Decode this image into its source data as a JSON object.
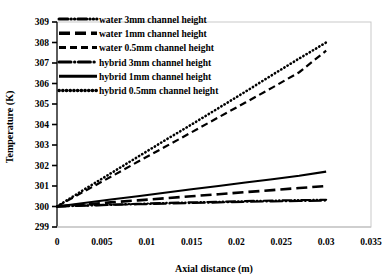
{
  "chart_data": {
    "type": "line",
    "title": "",
    "xlabel": "Axial distance (m)",
    "ylabel": "Temperature (K)",
    "xlim": [
      0,
      0.035
    ],
    "ylim": [
      299,
      309
    ],
    "xticks": [
      "0",
      "0.005",
      "0.01",
      "0.015",
      "0.02",
      "0.025",
      "0.03",
      "0.035"
    ],
    "xtick_values": [
      0,
      0.005,
      0.01,
      0.015,
      0.02,
      0.025,
      0.03,
      0.035
    ],
    "yticks": [
      "299",
      "300",
      "301",
      "302",
      "303",
      "304",
      "305",
      "306",
      "307",
      "308",
      "309"
    ],
    "ytick_values": [
      299,
      300,
      301,
      302,
      303,
      304,
      305,
      306,
      307,
      308,
      309
    ],
    "grid": false,
    "legend_position": "top-left",
    "x": [
      0,
      0.003,
      0.006,
      0.009,
      0.012,
      0.015,
      0.018,
      0.021,
      0.024,
      0.027,
      0.03
    ],
    "series": [
      {
        "name": "water 3mm channel height",
        "dash": "dashdotdot",
        "values": [
          300.0,
          300.05,
          300.09,
          300.13,
          300.17,
          300.2,
          300.23,
          300.26,
          300.29,
          300.31,
          300.33
        ]
      },
      {
        "name": "water 1mm channel height",
        "dash": "longdash",
        "values": [
          300.0,
          300.1,
          300.2,
          300.3,
          300.4,
          300.5,
          300.6,
          300.7,
          300.8,
          300.9,
          301.0
        ]
      },
      {
        "name": "water 0.5mm channel height",
        "dash": "dash",
        "values": [
          300.0,
          300.73,
          301.45,
          302.18,
          302.9,
          303.62,
          304.35,
          305.07,
          305.8,
          306.55,
          307.6
        ]
      },
      {
        "name": "hybrid 3mm channel height",
        "dash": "dashdot",
        "values": [
          300.0,
          300.04,
          300.08,
          300.11,
          300.14,
          300.17,
          300.2,
          300.23,
          300.25,
          300.27,
          300.29
        ]
      },
      {
        "name": "hybrid 1mm channel height",
        "dash": "solid",
        "values": [
          300.0,
          300.17,
          300.34,
          300.5,
          300.67,
          300.84,
          301.0,
          301.17,
          301.33,
          301.5,
          301.7
        ]
      },
      {
        "name": "hybrid 0.5mm channel height",
        "dash": "dot",
        "values": [
          300.0,
          300.82,
          301.62,
          302.42,
          303.22,
          304.0,
          304.8,
          305.6,
          306.42,
          307.22,
          308.0
        ]
      }
    ]
  },
  "legend": {
    "items": [
      {
        "label": "water 3mm channel height"
      },
      {
        "label": "water 1mm channel height"
      },
      {
        "label": "water 0.5mm channel height"
      },
      {
        "label": "hybrid 3mm channel height"
      },
      {
        "label": "hybrid 1mm channel height"
      },
      {
        "label": "hybrid 0.5mm channel height"
      }
    ]
  },
  "colors": {
    "series": "#000000",
    "frame": "#c9c9c9",
    "axis": "#000000",
    "background": "#ffffff"
  }
}
